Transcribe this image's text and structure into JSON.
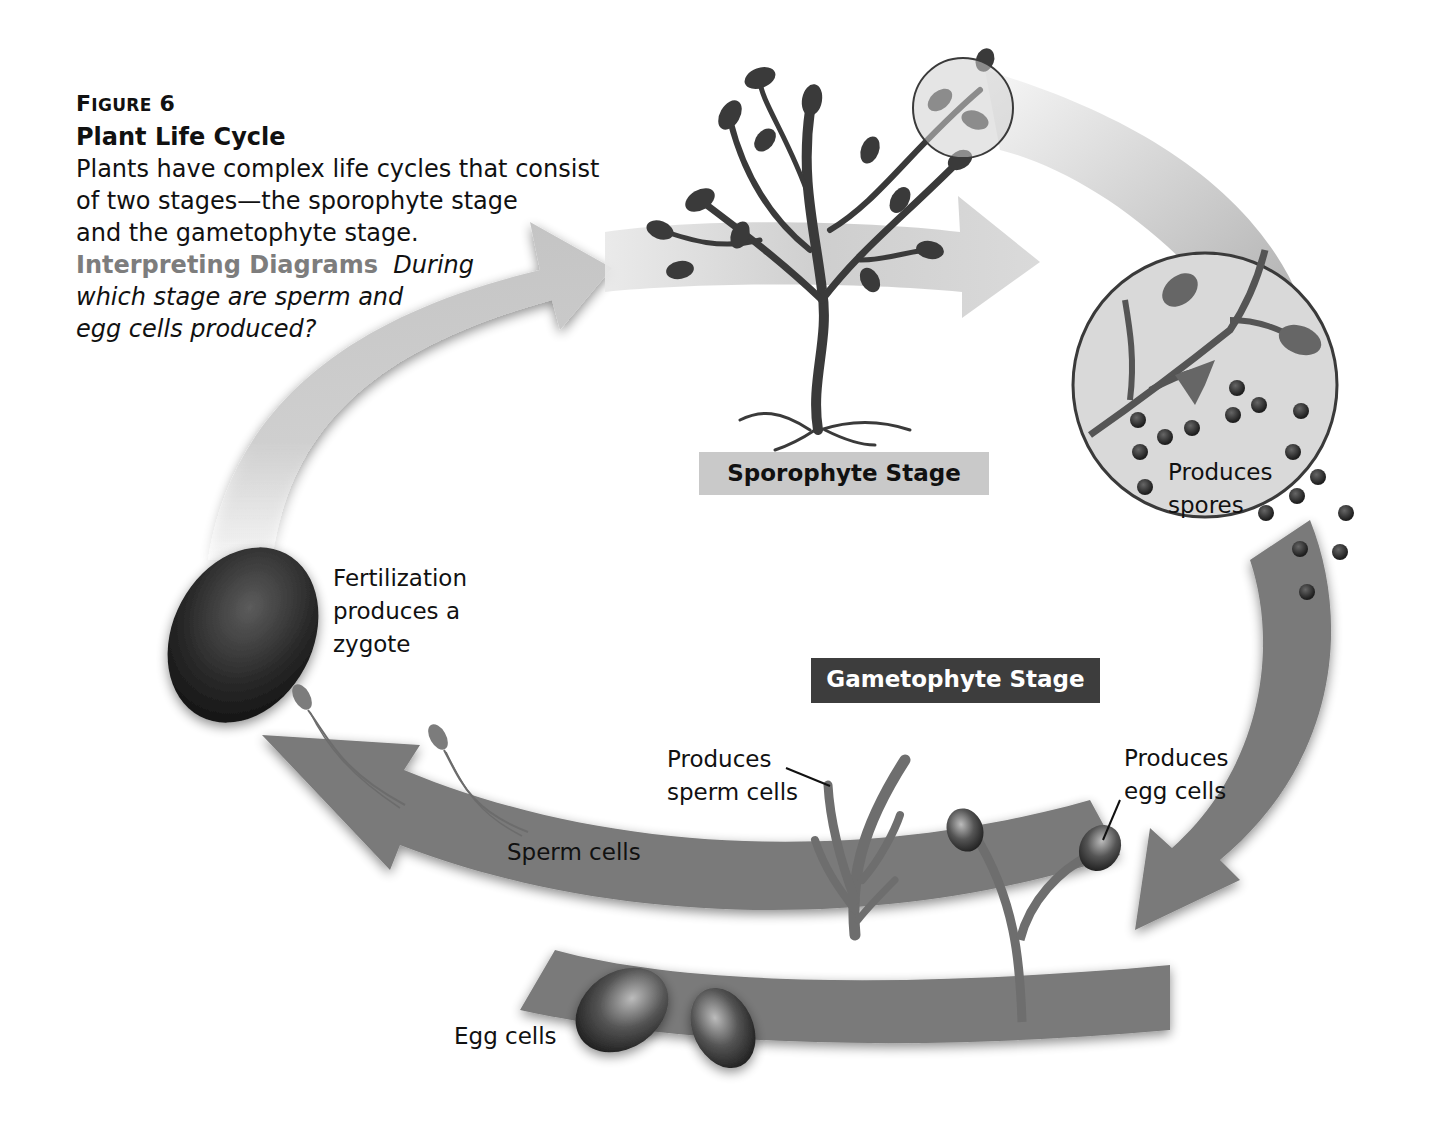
{
  "caption": {
    "figure_label_cap": "F",
    "figure_label_rest": "IGURE",
    "figure_number": "6",
    "title": "Plant Life Cycle",
    "body_lines": [
      "Plants have complex life cycles that consist",
      "of two stages—the sporophyte stage",
      "and the gametophyte stage."
    ],
    "interpreting_label": "Interpreting Diagrams",
    "question_lines": [
      "During",
      "which stage are sperm and",
      "egg cells produced?"
    ]
  },
  "stages": {
    "sporophyte": "Sporophyte Stage",
    "gametophyte": "Gametophyte Stage"
  },
  "labels": {
    "spores": [
      "Produces",
      "spores"
    ],
    "fertilization": [
      "Fertilization",
      "produces a",
      "zygote"
    ],
    "sperm_cells": "Sperm cells",
    "produces_sperm": [
      "Produces",
      "sperm cells"
    ],
    "produces_egg": [
      "Produces",
      "egg cells"
    ],
    "egg_cells": "Egg cells"
  },
  "colors": {
    "light_arrow": "#c8c8c8",
    "dark_arrow": "#7a7a7a",
    "sporophyte_box": "#c9c9c9",
    "gametophyte_box": "#3d3d3d",
    "interpreting_label": "#7d7d7d",
    "plant": "#3a3a3a"
  }
}
